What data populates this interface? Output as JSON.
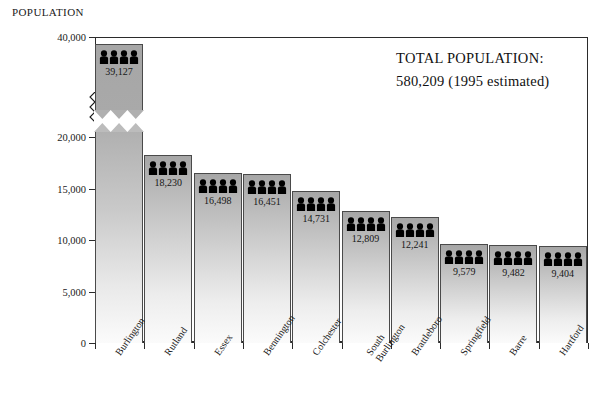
{
  "chart_data": {
    "type": "bar",
    "title": "",
    "ylabel": "POPULATION",
    "xlabel": "",
    "categories": [
      "Burlington",
      "Rutland",
      "Essex",
      "Bennington",
      "Colchester",
      "South Burlington",
      "Brattleboro",
      "Springfield",
      "Barre",
      "Hartford"
    ],
    "values": [
      39127,
      18230,
      16498,
      16451,
      14731,
      12809,
      12241,
      9579,
      9482,
      9404
    ],
    "value_labels": [
      "39,127",
      "18,230",
      "16,498",
      "16,451",
      "14,731",
      "12,809",
      "12,241",
      "9,579",
      "9,482",
      "9,404"
    ],
    "ytick_labels": [
      "40,000",
      "20,000",
      "15,000",
      "10,000",
      "5,000",
      "0"
    ],
    "ytick_values": [
      40000,
      20000,
      15000,
      10000,
      5000,
      0
    ],
    "ylim": [
      0,
      40000
    ],
    "axis_break": true,
    "axis_break_between": [
      20000,
      40000
    ],
    "grid": false,
    "legend": "none",
    "bar_icon": "people-group-icon",
    "annotations": [
      "TOTAL POPULATION:",
      "580,209  (1995 estimated)"
    ]
  },
  "callout": {
    "line1": "TOTAL POPULATION:",
    "line2": "580,209  (1995 estimated)"
  },
  "colors": {
    "bar_top": "#a6a6a6",
    "bar_bottom": "#fbfbfb",
    "bar_border": "#4a4a4a",
    "axis": "#2b2b2b",
    "text": "#1a1a1a",
    "icon": "#000000",
    "background": "#ffffff"
  }
}
